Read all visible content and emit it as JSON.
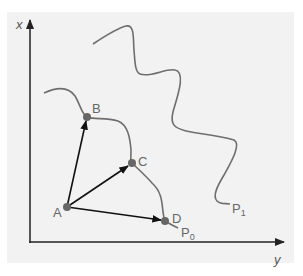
{
  "diagram": {
    "axes": {
      "vertical_label": "x",
      "horizontal_label": "y"
    },
    "points": [
      {
        "id": "A",
        "label": "A"
      },
      {
        "id": "B",
        "label": "B"
      },
      {
        "id": "C",
        "label": "C"
      },
      {
        "id": "D",
        "label": "D"
      }
    ],
    "curves": [
      {
        "id": "P0",
        "label": "P",
        "subscript": "0"
      },
      {
        "id": "P1",
        "label": "P",
        "subscript": "1"
      }
    ],
    "vectors": [
      {
        "from": "A",
        "to": "B"
      },
      {
        "from": "A",
        "to": "C"
      },
      {
        "from": "A",
        "to": "D"
      }
    ],
    "colors": {
      "background": "#f2f2f2",
      "axis": "#222222",
      "curve": "#6e6e6e",
      "point": "#666666",
      "vector": "#111111",
      "label": "#666666"
    }
  }
}
